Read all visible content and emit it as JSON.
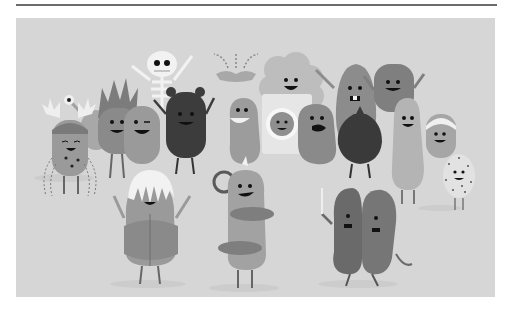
{
  "page": {
    "rule_color": "#6b6b6b",
    "background": "#ffffff"
  },
  "figure": {
    "alt": "Grayscale cartoon illustration of a crowd of bean-shaped characters waving and smiling",
    "background_color": "#d6d6d6",
    "style": "grayscale flat cartoon",
    "characters": [
      {
        "id": "antler-crab",
        "description": "character with antlers, cap, and dashed water streams",
        "position": "far left"
      },
      {
        "id": "eye-stalk",
        "description": "small creature with eye on a stalk",
        "position": "left back"
      },
      {
        "id": "spiky-hair",
        "description": "character with tall spiky hair",
        "position": "left back"
      },
      {
        "id": "skeleton",
        "description": "white skeleton waving arms",
        "position": "left top"
      },
      {
        "id": "winking-bean",
        "description": "bean character winking",
        "position": "left middle"
      },
      {
        "id": "bear",
        "description": "dark bear-eared character",
        "position": "left center"
      },
      {
        "id": "fountain",
        "description": "small dotted fountain/mustache shape",
        "position": "center top"
      },
      {
        "id": "big-grin-bean",
        "description": "bean with big toothy grin",
        "position": "center"
      },
      {
        "id": "fluffy",
        "description": "fluffy cloud-shaped character",
        "position": "center top"
      },
      {
        "id": "dryer",
        "description": "washing machine with face in window",
        "position": "center"
      },
      {
        "id": "shouting-bean",
        "description": "bean shouting",
        "position": "center"
      },
      {
        "id": "buck-tooth",
        "description": "tall pear-shaped character with buck teeth",
        "position": "right center"
      },
      {
        "id": "sack",
        "description": "dark sack/bag character",
        "position": "right"
      },
      {
        "id": "tall-bean",
        "description": "tall rounded rectangle waving",
        "position": "right top"
      },
      {
        "id": "pale-bean",
        "description": "pale tall bean",
        "position": "right"
      },
      {
        "id": "headband",
        "description": "character with sweatband",
        "position": "far right"
      },
      {
        "id": "speckled",
        "description": "speckled egg-shaped character",
        "position": "far right"
      },
      {
        "id": "white-hair",
        "description": "character with white mop hair and hooded jacket",
        "position": "front left"
      },
      {
        "id": "wheel-bean",
        "description": "bean with steering wheel and ring bands",
        "position": "front center"
      },
      {
        "id": "split-bean",
        "description": "two-halves bean holding a stick",
        "position": "front right"
      }
    ]
  }
}
